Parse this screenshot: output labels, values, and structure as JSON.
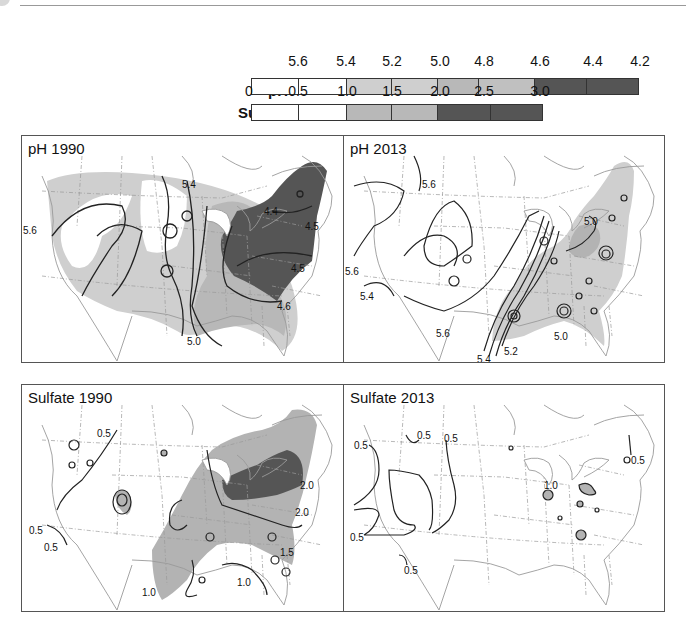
{
  "legend": {
    "ph": {
      "label": "pH",
      "ticks": [
        "5.6",
        "5.4",
        "5.2",
        "5.0",
        "4.8",
        "4.6",
        "4.4",
        "4.2"
      ],
      "segments": [
        {
          "range": "> 5.6",
          "color": "#ffffff"
        },
        {
          "range": "5.6-5.4",
          "color": "#ffffff"
        },
        {
          "range": "5.4-5.2",
          "color": "#cfcfcf"
        },
        {
          "range": "5.2-5.0",
          "color": "#cfcfcf"
        },
        {
          "range": "5.0-4.8",
          "color": "#b3b3b3"
        },
        {
          "range": "4.8-4.6",
          "color": "#b3b3b3"
        },
        {
          "range": "4.6-4.4",
          "color": "#555555"
        },
        {
          "range": "4.4-4.2",
          "color": "#555555"
        }
      ]
    },
    "sulfate": {
      "label": "Sulfate",
      "ticks": [
        "0",
        "0.5",
        "1.0",
        "1.5",
        "2.0",
        "2.5",
        "3.0"
      ],
      "segments": [
        {
          "range": "0-0.5",
          "color": "#ffffff"
        },
        {
          "range": "0.5-1.0",
          "color": "#ffffff"
        },
        {
          "range": "1.0-1.5",
          "color": "#b3b3b3"
        },
        {
          "range": "1.5-2.0",
          "color": "#b3b3b3"
        },
        {
          "range": "2.0-2.5",
          "color": "#555555"
        },
        {
          "range": "2.5-3.0",
          "color": "#555555"
        }
      ]
    }
  },
  "panels": [
    {
      "id": "ph-1990",
      "title": "pH 1990",
      "contour_labels": [
        "5.6",
        "5.4",
        "4.4",
        "4.5",
        "4.5",
        "4.6",
        "5.0"
      ]
    },
    {
      "id": "ph-2013",
      "title": "pH 2013",
      "contour_labels": [
        "5.6",
        "5.6",
        "5.4",
        "5.6",
        "5.4",
        "5.2",
        "5.0",
        "5.0"
      ]
    },
    {
      "id": "sulfate-1990",
      "title": "Sulfate 1990",
      "contour_labels": [
        "0.5",
        "0.5",
        "0.5",
        "2.0",
        "2.0",
        "1.5",
        "1.0",
        "1.0"
      ]
    },
    {
      "id": "sulfate-2013",
      "title": "Sulfate 2013",
      "contour_labels": [
        "0.5",
        "0.5",
        "0.5",
        "0.5",
        "0.5",
        "0.5",
        "1.0"
      ]
    }
  ],
  "colors": {
    "light": "#cfcfcf",
    "mid": "#b3b3b3",
    "dark": "#555555",
    "line": "#222222",
    "border": "#9a9a9a"
  }
}
